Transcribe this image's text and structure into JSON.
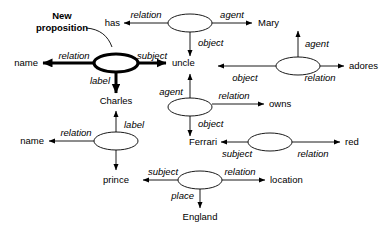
{
  "figure": {
    "type": "semantic-network",
    "annotation": {
      "label": "New proposition"
    }
  },
  "concepts": {
    "has": "has",
    "mary": "Mary",
    "name_top": "name",
    "uncle": "uncle",
    "adores": "adores",
    "charles": "Charles",
    "owns": "owns",
    "ferrari": "Ferrari",
    "red": "red",
    "name_bottom": "name",
    "prince": "prince",
    "location": "location",
    "england": "England"
  },
  "arc_labels": {
    "relation": "relation",
    "agent": "agent",
    "object": "object",
    "subject": "subject",
    "label": "label",
    "place": "place"
  },
  "propositions": [
    {
      "id": "p-has-mary-uncle",
      "highlighted": false,
      "arcs": [
        {
          "role": "relation",
          "target": "has"
        },
        {
          "role": "agent",
          "target": "Mary"
        },
        {
          "role": "object",
          "target": "uncle"
        }
      ]
    },
    {
      "id": "p-new-name-charles-uncle",
      "highlighted": true,
      "arcs": [
        {
          "role": "relation",
          "target": "name"
        },
        {
          "role": "subject",
          "target": "uncle"
        },
        {
          "role": "label",
          "target": "Charles"
        }
      ]
    },
    {
      "id": "p-adores-mary-uncle",
      "highlighted": false,
      "arcs": [
        {
          "role": "agent",
          "target": "Mary"
        },
        {
          "role": "relation",
          "target": "adores"
        },
        {
          "role": "object",
          "target": "uncle"
        }
      ]
    },
    {
      "id": "p-owns-uncle-ferrari",
      "highlighted": false,
      "arcs": [
        {
          "role": "agent",
          "target": "uncle"
        },
        {
          "role": "relation",
          "target": "owns"
        },
        {
          "role": "object",
          "target": "Ferrari"
        }
      ]
    },
    {
      "id": "p-red-ferrari",
      "highlighted": false,
      "arcs": [
        {
          "role": "subject",
          "target": "Ferrari"
        },
        {
          "role": "relation",
          "target": "red"
        }
      ]
    },
    {
      "id": "p-location-prince-england",
      "highlighted": false,
      "arcs": [
        {
          "role": "subject",
          "target": "prince"
        },
        {
          "role": "relation",
          "target": "location"
        },
        {
          "role": "place",
          "target": "England"
        }
      ]
    },
    {
      "id": "p-name-prince-charles",
      "highlighted": false,
      "arcs": [
        {
          "role": "relation",
          "target": "name"
        },
        {
          "role": "label",
          "target": "Charles"
        },
        {
          "role": "subject",
          "target": "prince"
        }
      ]
    }
  ],
  "arc_instances": [
    {
      "from": "p-has-mary-uncle",
      "role": "relation",
      "to": "has"
    },
    {
      "from": "p-has-mary-uncle",
      "role": "agent",
      "to": "Mary"
    },
    {
      "from": "p-has-mary-uncle",
      "role": "object",
      "to": "uncle"
    },
    {
      "from": "p-new-name-charles-uncle",
      "role": "relation",
      "to": "name"
    },
    {
      "from": "p-new-name-charles-uncle",
      "role": "subject",
      "to": "uncle"
    },
    {
      "from": "p-new-name-charles-uncle",
      "role": "label",
      "to": "Charles"
    },
    {
      "from": "p-adores-mary-uncle",
      "role": "agent",
      "to": "Mary"
    },
    {
      "from": "p-adores-mary-uncle",
      "role": "relation",
      "to": "adores"
    },
    {
      "from": "p-adores-mary-uncle",
      "role": "object",
      "to": "uncle"
    },
    {
      "from": "p-owns-uncle-ferrari",
      "role": "agent",
      "to": "uncle"
    },
    {
      "from": "p-owns-uncle-ferrari",
      "role": "relation",
      "to": "owns"
    },
    {
      "from": "p-owns-uncle-ferrari",
      "role": "object",
      "to": "Ferrari"
    },
    {
      "from": "p-red-ferrari",
      "role": "subject",
      "to": "Ferrari"
    },
    {
      "from": "p-red-ferrari",
      "role": "relation",
      "to": "red"
    },
    {
      "from": "p-location-prince-england",
      "role": "subject",
      "to": "prince"
    },
    {
      "from": "p-location-prince-england",
      "role": "relation",
      "to": "location"
    },
    {
      "from": "p-location-prince-england",
      "role": "place",
      "to": "England"
    },
    {
      "from": "p-name-prince-charles",
      "role": "relation",
      "to": "name"
    },
    {
      "from": "p-name-prince-charles",
      "role": "label",
      "to": "Charles"
    },
    {
      "from": "p-name-prince-charles",
      "role": "subject",
      "to": "prince"
    }
  ],
  "colors": {
    "background": "#ffffff",
    "stroke": "#000000",
    "node_fill": "#ffffff"
  }
}
